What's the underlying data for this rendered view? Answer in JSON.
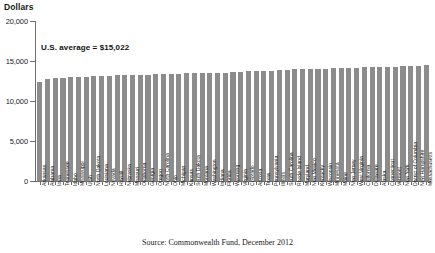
{
  "chart_data": {
    "type": "bar",
    "title": "",
    "ylabel": "Dollars",
    "xlabel": "",
    "ylim": [
      0,
      20000
    ],
    "ytick_labels": [
      "20,000",
      "15,000",
      "10,000",
      "5,000",
      "0"
    ],
    "ytick_values": [
      20000,
      15000,
      10000,
      5000,
      0
    ],
    "grid": false,
    "legend": "none",
    "bar_color": "#8c8c8c",
    "annotation": "U.S. average = $15,022",
    "annotation_value": 15022,
    "source": "Source: Commonwealth Fund, December 2012",
    "categories": [
      "Arkansas",
      "Alabama",
      "Iowa",
      "Tennessee",
      "Idaho",
      "Mississippi",
      "Utah",
      "North Dakota",
      "Louisiana",
      "Nevada",
      "Hawaii",
      "Nebraska",
      "Missouri",
      "Oklahoma",
      "Georgia",
      "Oregon",
      "North Carolina",
      "Ohio",
      "Michigan",
      "Kansas",
      "South Dakota",
      "Montana",
      "Washington",
      "Indiana",
      "Florida",
      "Wyoming",
      "Virginia",
      "Colorado",
      "Arizona",
      "Texas",
      "Pennsylvania",
      "Illinois",
      "South Carolina",
      "Rhode Island",
      "Maryland",
      "New Mexico",
      "Kentucky",
      "Wisconsin",
      "Minnesota",
      "Maine",
      "New Jersey",
      "West Virginia",
      "California",
      "Delaware",
      "Alaska",
      "Connecticut",
      "Vermont",
      "New York",
      "District of Columbia",
      "New Hampshire",
      "Massachusetts"
    ],
    "values": [
      12400,
      12800,
      12850,
      12900,
      12950,
      13000,
      13050,
      13100,
      13150,
      13150,
      13200,
      13200,
      13250,
      13300,
      13300,
      13350,
      13350,
      13400,
      13400,
      13450,
      13450,
      13500,
      13500,
      13550,
      13550,
      13600,
      13650,
      13700,
      13750,
      13750,
      13800,
      13850,
      13900,
      13950,
      14000,
      14000,
      14050,
      14050,
      14100,
      14100,
      14150,
      14150,
      14200,
      14200,
      14250,
      14250,
      14300,
      14350,
      14400,
      14400,
      14550
    ]
  }
}
